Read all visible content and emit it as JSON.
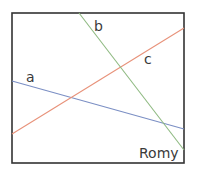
{
  "diagram": {
    "frame": {
      "x": 12,
      "y": 13,
      "width": 172,
      "height": 150,
      "stroke": "#333333"
    },
    "lines": [
      {
        "name": "a",
        "color": "#7b8fc4",
        "x1": 12,
        "y1": 81,
        "x2": 184,
        "y2": 129
      },
      {
        "name": "b",
        "color": "#8fba82",
        "x1": 79,
        "y1": 13,
        "x2": 184,
        "y2": 150
      },
      {
        "name": "c",
        "color": "#e8927a",
        "x1": 12,
        "y1": 134,
        "x2": 184,
        "y2": 28
      }
    ],
    "labels": {
      "a": "a",
      "b": "b",
      "c": "c",
      "author": "Romy"
    }
  }
}
